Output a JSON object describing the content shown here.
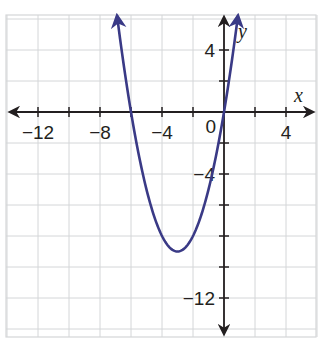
{
  "chart_data": {
    "type": "line",
    "title": "",
    "xlabel": "x",
    "ylabel": "y",
    "xlim": [
      -14,
      6
    ],
    "ylim": [
      -14.5,
      6.2
    ],
    "grid": true,
    "grid_step": 2,
    "x_ticks": [
      -12,
      -8,
      -4,
      0,
      4
    ],
    "x_tick_labels": [
      "−12",
      "−8",
      "−4",
      "0",
      "4"
    ],
    "y_ticks": [
      4,
      -4,
      -12
    ],
    "y_tick_labels": [
      "4",
      "−4",
      "−12"
    ],
    "minor_tick_marks_x": [
      -12,
      -10,
      -8,
      -6,
      -4,
      -2,
      2,
      4
    ],
    "minor_tick_marks_y": [
      4,
      2,
      -2,
      -4,
      -6,
      -8,
      -10,
      -12
    ],
    "series": [
      {
        "name": "parabola",
        "equation": "y = x^2 + 6x",
        "color": "#3a3a86",
        "vertex": [
          -3,
          -9
        ],
        "x_intercepts": [
          -6,
          0
        ],
        "x_range": [
          -6.9,
          0.9
        ],
        "arrows_at_ends": true,
        "points": [
          {
            "x": -6.9,
            "y": 6.21
          },
          {
            "x": -6,
            "y": 0
          },
          {
            "x": -5,
            "y": -5
          },
          {
            "x": -4,
            "y": -8
          },
          {
            "x": -3,
            "y": -9
          },
          {
            "x": -2,
            "y": -8
          },
          {
            "x": -1,
            "y": -5
          },
          {
            "x": 0,
            "y": 0
          },
          {
            "x": 0.9,
            "y": 6.21
          }
        ]
      }
    ],
    "colors": {
      "curve": "#3a3a86",
      "axes": "#231f20",
      "grid": "#d4d6d8",
      "background": "#ffffff"
    }
  },
  "labels": {
    "x_axis": "x",
    "y_axis": "y",
    "origin": "0"
  }
}
